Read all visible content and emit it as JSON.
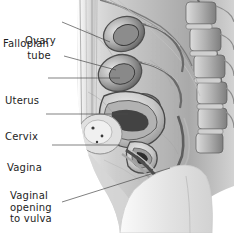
{
  "figure": {
    "background_color": "#ffffff",
    "text_color": "#1d1d1d",
    "leader_color": "#4a4a4a",
    "width": 234,
    "height": 233
  },
  "labels": [
    {
      "id": "ovary",
      "text": "Ovary",
      "lines": [
        "Ovary"
      ],
      "x": 25,
      "y": 12,
      "leader": "M 62 22 L 110 42"
    },
    {
      "id": "fallopian-tube",
      "text": "Fallopian tube",
      "lines": [
        "Fallopian",
        "tube"
      ],
      "x": 3,
      "y": 38,
      "align": "mixed",
      "leader": "M 64 56 L 116 70"
    },
    {
      "id": "uterus",
      "text": "Uterus",
      "lines": [
        "Uterus"
      ],
      "x": 5,
      "y": 72,
      "leader": "M 48 78 L 120 78"
    },
    {
      "id": "cervix",
      "text": "Cervix",
      "lines": [
        "Cervix"
      ],
      "x": 5,
      "y": 108,
      "leader": "M 46 114 L 128 114"
    },
    {
      "id": "vagina",
      "text": "Vagina",
      "lines": [
        "Vagina"
      ],
      "x": 7,
      "y": 139,
      "leader": "M 52 145 L 120 145"
    },
    {
      "id": "vaginal-opening-to-vulva",
      "text": "Vaginal opening to vulva",
      "lines": [
        "Vaginal",
        "opening",
        "to  vulva"
      ],
      "x": 10,
      "y": 190,
      "leader": "M 62 202 L 170 168"
    }
  ],
  "anatomy": {
    "description": "Grayscale sagittal section of the female pelvis showing ovary, fallopian tube, uterus, cervix, vagina and vaginal opening with lumbar vertebrae along the posterior margin",
    "palette": {
      "tissue_light": "#e9e9e9",
      "tissue_mid": "#b8b8b8",
      "tissue_dark": "#6f6f6f",
      "tissue_darkest": "#2c2c2c",
      "thigh": "#e3e3e3",
      "outline": "#8a8a8a"
    }
  }
}
